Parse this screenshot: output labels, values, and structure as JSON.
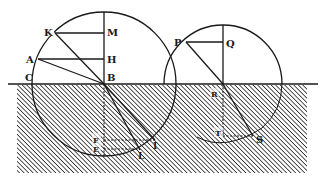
{
  "figure": {
    "colors": {
      "ink": "#1a1a1a",
      "background": "#ffffff",
      "hatch": "#2a2a2a"
    },
    "surface_line": {
      "x1": 8,
      "x2": 318,
      "y": 84
    },
    "hatched_medium": {
      "x": 17,
      "y": 85,
      "width": 290,
      "height": 88
    },
    "left_circle": {
      "center_label": "B",
      "cx": 104,
      "cy": 84,
      "r": 72
    },
    "right_circle": {
      "center_label": "R",
      "cx": 223,
      "cy": 84,
      "r": 59
    },
    "labels": {
      "K": "K",
      "M": "M",
      "A": "A",
      "H": "H",
      "C": "C",
      "B": "B",
      "F": "F",
      "E": "E",
      "I": "I",
      "L": "L",
      "P": "P",
      "Q": "Q",
      "R": "R",
      "T": "T",
      "S": "S"
    }
  }
}
